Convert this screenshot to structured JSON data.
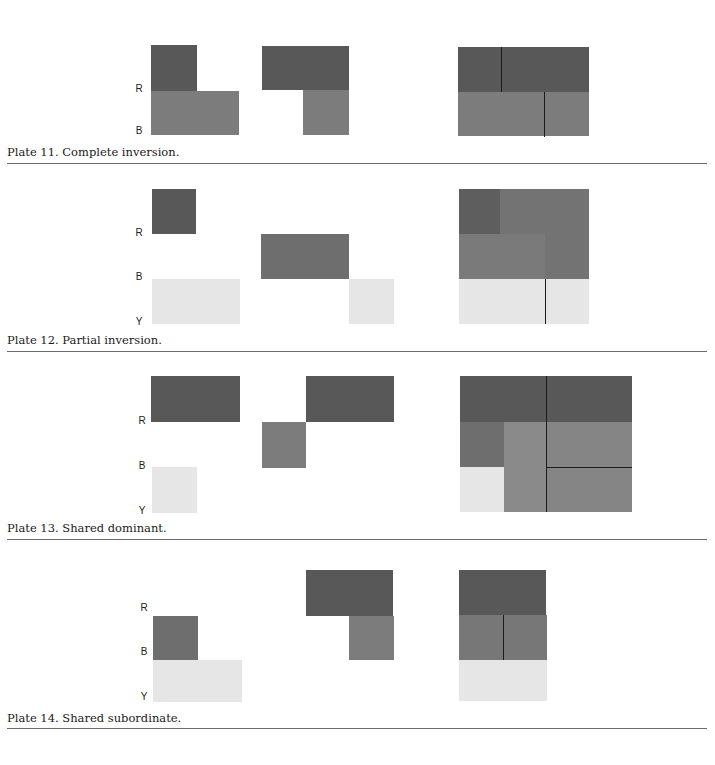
{
  "colors": {
    "R": "#585858",
    "B": "#7c7c7c",
    "Y": "#e6e6e6",
    "mix_RB": "#6e6e6e",
    "mix_BY": "#8a8a8a",
    "line": "#1c1c1c",
    "rule": "#6a6a6a"
  },
  "axis_labels": {
    "R": "R",
    "B": "B",
    "Y": "Y"
  },
  "plates": [
    {
      "id": 11,
      "caption": "Plate 11. Complete inversion."
    },
    {
      "id": 12,
      "caption": "Plate 12. Partial inversion."
    },
    {
      "id": 13,
      "caption": "Plate 13. Shared dominant."
    },
    {
      "id": 14,
      "caption": "Plate 14. Shared subordinate."
    }
  ]
}
